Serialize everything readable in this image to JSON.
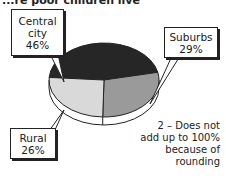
{
  "header": {
    "title_fragment": "...re poor children live"
  },
  "chart_data": {
    "type": "pie",
    "title": "...re poor children live",
    "categories": [
      "Central city",
      "Suburbs",
      "Rural"
    ],
    "values": [
      46,
      29,
      26
    ],
    "units": "%",
    "colors": [
      "#262626",
      "#9a9a9a",
      "#d9d9d9"
    ],
    "style": "3d-pie",
    "labels": [
      {
        "line1": "Central",
        "line2": "city",
        "value": "46%"
      },
      {
        "line1": "Suburbs",
        "value": "29%"
      },
      {
        "line1": "Rural",
        "value": "26%"
      }
    ],
    "annotation": "2 – Does not add up to 100% because of rounding"
  },
  "callouts": {
    "central": {
      "line1": "Central",
      "line2": "city",
      "value": "46%"
    },
    "suburbs": {
      "line1": "Suburbs",
      "value": "29%"
    },
    "rural": {
      "line1": "Rural",
      "value": "26%"
    }
  },
  "note": {
    "text": "2 – Does not add up to 100% because of rounding"
  }
}
